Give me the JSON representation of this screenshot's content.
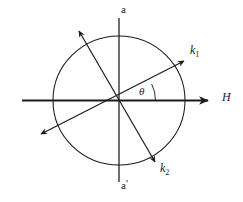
{
  "figure": {
    "kind": "vector-diagram",
    "background_color": "#ffffff",
    "stroke_color": "#1b1b1b",
    "labels": {
      "axis_top": "a",
      "axis_bottom_base": "a",
      "axis_bottom_prime": "'",
      "field_axis": "H",
      "vector_k1_base": "k",
      "vector_k1_sub": "1",
      "vector_k2_base": "k",
      "vector_k2_sub": "2",
      "angle": "θ"
    },
    "geometry": {
      "center": {
        "x": 119,
        "y": 100
      },
      "circle_radius_x": 66,
      "circle_radius_y": 64,
      "horizontal_axis": {
        "x_start": 22,
        "x_end": 212,
        "y": 100
      },
      "vertical_axis": {
        "x": 119,
        "y_start": 18,
        "y_end": 182
      },
      "vector_k1_tip": {
        "x": 187,
        "y": 58
      },
      "vector_k2_tip": {
        "x": 157,
        "y": 165
      },
      "vector_upper_left_tip": {
        "x": 76,
        "y": 27
      },
      "vector_lower_left_tip": {
        "x": 37,
        "y": 138
      },
      "angle_arc_radius": 36
    }
  }
}
